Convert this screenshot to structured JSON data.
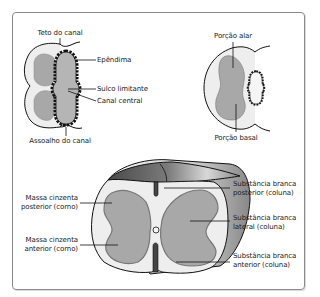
{
  "diagram": {
    "top_left": {
      "labels": {
        "roof": "Teto do canal",
        "ependyma": "Epêndima",
        "sulcus": "Sulco limitante",
        "central_canal": "Canal central",
        "floor": "Assoalho do canal"
      }
    },
    "top_right": {
      "labels": {
        "alar": "Porção alar",
        "basal": "Porção basal"
      }
    },
    "bottom": {
      "left_labels": {
        "posterior_gray_1": "Massa cinzenta",
        "posterior_gray_2": "posterior (corno)",
        "anterior_gray_1": "Massa cinzenta",
        "anterior_gray_2": "anterior (corno)"
      },
      "right_labels": {
        "posterior_white_1": "Substância branca",
        "posterior_white_2": "posterior (coluna)",
        "lateral_white_1": "Substância branca",
        "lateral_white_2": "lateral (coluna)",
        "anterior_white_1": "Substância branca",
        "anterior_white_2": "anterior (coluna)"
      }
    },
    "colors": {
      "white_matter": "#eeeeee",
      "gray_matter": "#a6a6a6",
      "outline": "#111111",
      "dark_surface": "#555555"
    }
  }
}
